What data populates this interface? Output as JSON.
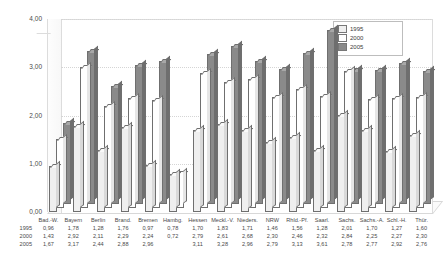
{
  "chart_data": {
    "type": "bar",
    "title": "",
    "xlabel": "",
    "ylabel": "",
    "ylim": [
      0,
      4
    ],
    "yticks": [
      "0,00",
      "1,00",
      "2,00",
      "3,00",
      "4,00"
    ],
    "grid": true,
    "legend_position": "top-right",
    "categories": [
      "Bad.-W.",
      "Bayern",
      "Berlin",
      "Brand.",
      "Bremen",
      "Hambg.",
      "Hessen",
      "Meckl.-V.",
      "Nieders.",
      "NRW",
      "Rhld.-Pf.",
      "Saarl.",
      "Sachs.",
      "Sachs.-A.",
      "Schl.-H.",
      "Thür."
    ],
    "series": [
      {
        "name": "1995",
        "values": [
          0.96,
          1.78,
          1.28,
          1.76,
          0.97,
          0.78,
          1.7,
          1.83,
          1.71,
          1.46,
          1.56,
          1.28,
          2.01,
          1.7,
          1.27,
          1.6
        ]
      },
      {
        "name": "2000",
        "values": [
          1.43,
          2.92,
          2.11,
          2.29,
          2.24,
          0.72,
          2.79,
          2.61,
          2.68,
          2.3,
          2.46,
          2.32,
          2.84,
          2.25,
          2.27,
          2.3
        ]
      },
      {
        "name": "2005",
        "values": [
          1.67,
          3.17,
          2.44,
          2.88,
          2.96,
          null,
          3.11,
          3.28,
          2.96,
          2.79,
          3.13,
          3.61,
          2.78,
          2.77,
          2.92,
          2.76
        ]
      }
    ]
  },
  "legend": {
    "items": [
      {
        "label": "1995",
        "color": "#efefef"
      },
      {
        "label": "2000",
        "color": "#ffffff"
      },
      {
        "label": "2005",
        "color": "#8a8a8a"
      }
    ]
  },
  "table": {
    "row_labels": [
      "1995",
      "2000",
      "2005"
    ],
    "headers": [
      "Bad.-W.",
      "Bayern",
      "Berlin",
      "Brand.",
      "Bremen",
      "Hambg.",
      "Hessen",
      "Meckl.-V.",
      "Nieders.",
      "NRW",
      "Rhld.-Pf.",
      "Saarl.",
      "Sachs.",
      "Sachs.-A.",
      "Schl.-H.",
      "Thür."
    ],
    "rows": [
      [
        "0,96",
        "1,78",
        "1,28",
        "1,76",
        "0,97",
        "0,78",
        "1,70",
        "1,83",
        "1,71",
        "1,46",
        "1,56",
        "1,28",
        "2,01",
        "1,70",
        "1,27",
        "1,60"
      ],
      [
        "1,43",
        "2,92",
        "2,11",
        "2,29",
        "2,24",
        "0,72",
        "2,79",
        "2,61",
        "2,68",
        "2,30",
        "2,46",
        "2,32",
        "2,84",
        "2,25",
        "2,27",
        "2,30"
      ],
      [
        "1,67",
        "3,17",
        "2,44",
        "2,88",
        "2,96",
        "",
        "3,11",
        "3,28",
        "2,96",
        "2,79",
        "3,13",
        "3,61",
        "2,78",
        "2,77",
        "2,92",
        "2,76"
      ]
    ]
  }
}
